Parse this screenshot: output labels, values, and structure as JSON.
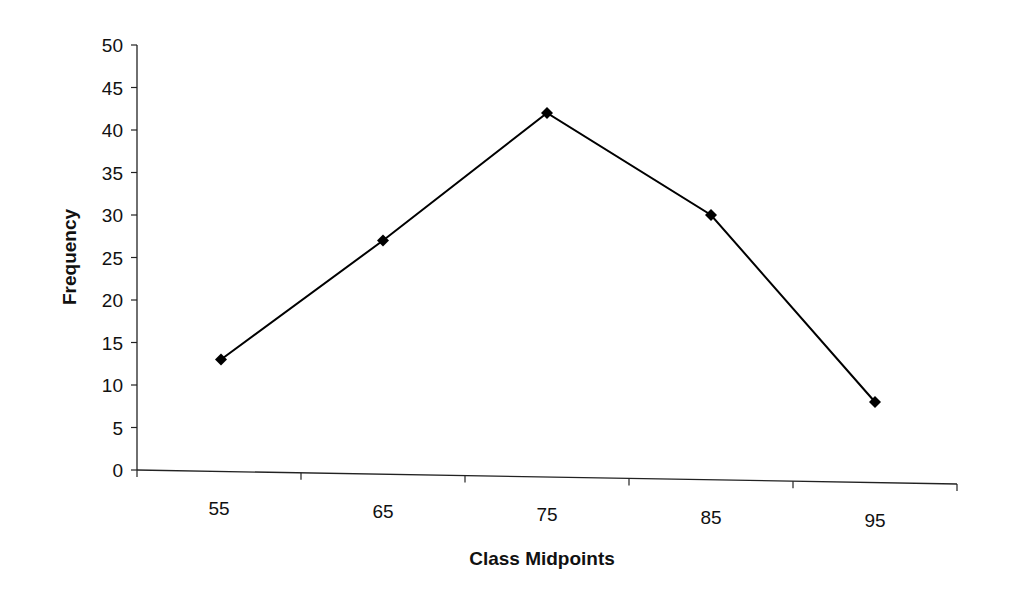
{
  "chart_data": {
    "type": "line",
    "title": "",
    "xlabel": "Class Midpoints",
    "ylabel": "Frequency",
    "categories": [
      "55",
      "65",
      "75",
      "85",
      "95"
    ],
    "series": [
      {
        "name": "Frequency",
        "values": [
          13,
          27,
          42,
          30,
          8
        ],
        "marker": "diamond",
        "color": "#000000"
      }
    ],
    "ylim": [
      0,
      50
    ],
    "yticks": [
      0,
      5,
      10,
      15,
      20,
      25,
      30,
      35,
      40,
      45,
      50
    ],
    "grid": false,
    "legend": "none"
  }
}
